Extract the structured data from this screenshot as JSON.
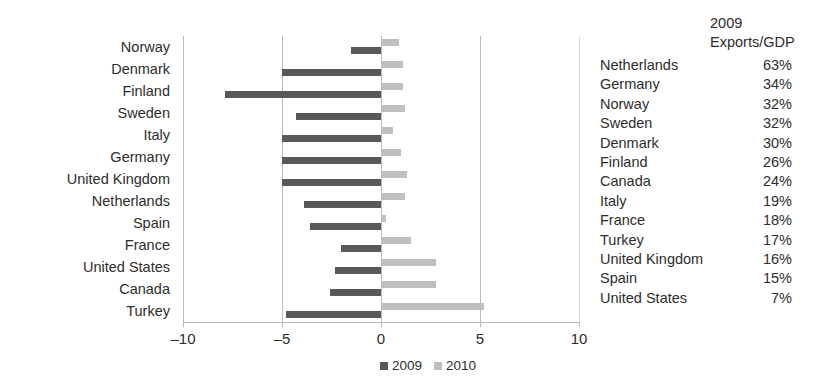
{
  "chart_data": {
    "type": "bar",
    "orientation": "horizontal",
    "title": "",
    "xlabel": "",
    "ylabel": "",
    "xlim": [
      -10,
      10
    ],
    "xticks": [
      -10,
      -5,
      0,
      5,
      10
    ],
    "xtick_labels": [
      "–10",
      "–5",
      "0",
      "5",
      "10"
    ],
    "grid": true,
    "legend_position": "bottom",
    "categories": [
      "Norway",
      "Denmark",
      "Finland",
      "Sweden",
      "Italy",
      "Germany",
      "United Kingdom",
      "Netherlands",
      "Spain",
      "France",
      "United States",
      "Canada",
      "Turkey"
    ],
    "series": [
      {
        "name": "2009",
        "color": "#595959",
        "values": [
          -1.5,
          -5.0,
          -7.9,
          -4.3,
          -5.0,
          -5.0,
          -5.0,
          -3.9,
          -3.6,
          -2.0,
          -2.3,
          -2.6,
          -4.8
        ]
      },
      {
        "name": "2010",
        "color": "#bfbfbf",
        "values": [
          0.9,
          1.1,
          1.1,
          1.2,
          0.6,
          1.0,
          1.3,
          1.2,
          0.25,
          1.5,
          2.8,
          2.8,
          5.2
        ]
      }
    ]
  },
  "side_table": {
    "header_line1": "2009",
    "header_line2": "Exports/GDP",
    "columns": [
      "Country",
      "2009 Exports/GDP"
    ],
    "rows": [
      {
        "country": "Netherlands",
        "value": "63%"
      },
      {
        "country": "Germany",
        "value": "34%"
      },
      {
        "country": "Norway",
        "value": "32%"
      },
      {
        "country": "Sweden",
        "value": "32%"
      },
      {
        "country": "Denmark",
        "value": "30%"
      },
      {
        "country": "Finland",
        "value": "26%"
      },
      {
        "country": "Canada",
        "value": "24%"
      },
      {
        "country": "Italy",
        "value": "19%"
      },
      {
        "country": "France",
        "value": "18%"
      },
      {
        "country": "Turkey",
        "value": "17%"
      },
      {
        "country": "United Kingdom",
        "value": "16%"
      },
      {
        "country": "Spain",
        "value": "15%"
      },
      {
        "country": "United States",
        "value": "7%"
      }
    ]
  },
  "colors": {
    "series_2009": "#595959",
    "series_2010": "#bfbfbf",
    "gridline": "#b9b9b9",
    "text": "#2d2d2d",
    "background": "#ffffff"
  }
}
